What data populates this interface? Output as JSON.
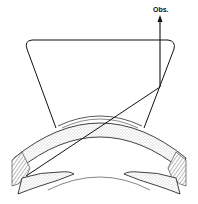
{
  "diagram": {
    "title": "",
    "labels": {
      "observer": "Obs."
    },
    "elements": [
      {
        "name": "goniolens",
        "shape": "trapezoid-with-rounded-top-corners"
      },
      {
        "name": "cornea",
        "shape": "stippled-arc"
      },
      {
        "name": "light-ray",
        "path": "from angle recess to mirror, reflected upward to observer"
      },
      {
        "name": "iris-left",
        "shape": "stippled-band"
      },
      {
        "name": "iris-right",
        "shape": "stippled-band"
      },
      {
        "name": "lens-surface-arc",
        "shape": "thin-arc"
      },
      {
        "name": "sclera-left",
        "shape": "hatched-tissue"
      },
      {
        "name": "sclera-right",
        "shape": "hatched-tissue"
      }
    ],
    "colors": {
      "line": "#111111",
      "stipple": "#8a8a8a",
      "background": "#ffffff"
    }
  }
}
